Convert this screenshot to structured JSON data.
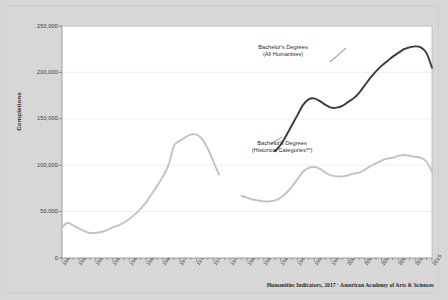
{
  "figure": {
    "title": "",
    "background_color": "#d7d7d7",
    "plot_background_color": "#ffffff",
    "source_note": "Humanities Indicators, 2017 · American Academy of Arts & Sciences"
  },
  "annotations": [
    {
      "name": "all-humanities-label",
      "line1": "Bachelor's Degrees",
      "line2": "(All Humanities)",
      "x": 283,
      "y": 44
    },
    {
      "name": "historical-categories-label",
      "line1": "Bachelor's Degrees",
      "line2": "(Historical Categories**)",
      "x": 282,
      "y": 140
    }
  ],
  "chart_data": {
    "type": "line",
    "title": "",
    "subtitle": "",
    "xlabel": "",
    "ylabel": "Completions",
    "xlim": [
      1949,
      2015
    ],
    "ylim": [
      0,
      250000
    ],
    "grid": true,
    "grid_axis": "y",
    "legend_position": "inline-annotations",
    "ytick_labels": [
      "0",
      "50,000",
      "100,000",
      "150,000",
      "200,000",
      "250,000"
    ],
    "ytick_values": [
      0,
      50000,
      100000,
      150000,
      200000,
      250000
    ],
    "xtick_labels": [
      "1949",
      "1952",
      "1955",
      "1958",
      "1961",
      "1964",
      "1967",
      "1970",
      "1973",
      "1976",
      "1979",
      "1982",
      "1985",
      "1988",
      "1991",
      "1994",
      "1997",
      "2000",
      "2003",
      "2006",
      "2009",
      "2012",
      "2015"
    ],
    "xtick_values": [
      1949,
      1952,
      1955,
      1958,
      1961,
      1964,
      1967,
      1970,
      1973,
      1976,
      1979,
      1982,
      1985,
      1988,
      1991,
      1994,
      1997,
      2000,
      2003,
      2006,
      2009,
      2012,
      2015
    ],
    "series": [
      {
        "name": "Bachelor's Degrees (All Humanities)",
        "color": "#3b3b3b",
        "width": 1.9,
        "x": [
          1987,
          1988,
          1989,
          1990,
          1991,
          1992,
          1993,
          1994,
          1995,
          1996,
          1997,
          1998,
          1999,
          2000,
          2001,
          2002,
          2003,
          2004,
          2005,
          2006,
          2007,
          2008,
          2009,
          2010,
          2011,
          2012,
          2013,
          2014,
          2015
        ],
        "values": [
          115000,
          122000,
          132000,
          143000,
          154000,
          165000,
          171000,
          172000,
          169000,
          165000,
          162000,
          162000,
          164000,
          168000,
          172000,
          178000,
          186000,
          194000,
          201000,
          207000,
          212000,
          217000,
          221000,
          225000,
          227000,
          228000,
          227000,
          221000,
          205000
        ]
      },
      {
        "name": "Bachelor's Degrees (Historical Categories**)",
        "color": "#c2c2c2",
        "width": 1.9,
        "gap_years": [
          1978,
          1979,
          1980
        ],
        "x": [
          1949,
          1950,
          1951,
          1952,
          1953,
          1954,
          1955,
          1956,
          1957,
          1958,
          1959,
          1960,
          1961,
          1962,
          1963,
          1964,
          1965,
          1966,
          1967,
          1968,
          1969,
          1970,
          1971,
          1972,
          1973,
          1974,
          1975,
          1976,
          1977,
          1981,
          1982,
          1983,
          1984,
          1985,
          1986,
          1987,
          1988,
          1989,
          1990,
          1991,
          1992,
          1993,
          1994,
          1995,
          1996,
          1997,
          1998,
          1999,
          2000,
          2001,
          2002,
          2003,
          2004,
          2005,
          2006,
          2007,
          2008,
          2009,
          2010,
          2011,
          2012,
          2013,
          2014,
          2015
        ],
        "values": [
          33000,
          38000,
          35000,
          32000,
          29000,
          27000,
          27000,
          28000,
          30000,
          33000,
          35000,
          38000,
          42000,
          47000,
          53000,
          60000,
          69000,
          78000,
          88000,
          100000,
          121000,
          126000,
          130000,
          133000,
          133000,
          128000,
          118000,
          104000,
          90000,
          67000,
          65000,
          63000,
          62000,
          61000,
          61000,
          62000,
          65000,
          70000,
          77000,
          85000,
          93000,
          97000,
          98000,
          96000,
          92000,
          89000,
          88000,
          88000,
          89000,
          91000,
          92000,
          95000,
          99000,
          102000,
          105000,
          107000,
          108000,
          110000,
          111000,
          110000,
          109000,
          108000,
          104000,
          93000
        ]
      }
    ]
  }
}
